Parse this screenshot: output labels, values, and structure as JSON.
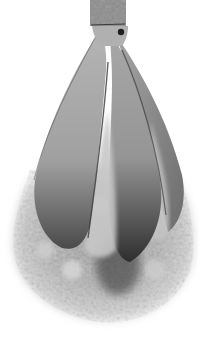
{
  "image": {
    "subject": "grayscale photo of a bud-shaped object with a cap on top, three petal segments, and crumbly fluffy material at the bottom",
    "alt": "Bud-shaped object with petals and crumbly base",
    "colors": {
      "background": "#ffffff",
      "cap": "#8c8c8c",
      "cap_band": "#3a3a3a",
      "petal_light": "#b8b8b8",
      "petal_mid": "#9a9a9a",
      "petal_dark": "#3c3c3c",
      "crumb_light": "#d8d8d8",
      "crumb_mid": "#a8a8a8"
    }
  }
}
